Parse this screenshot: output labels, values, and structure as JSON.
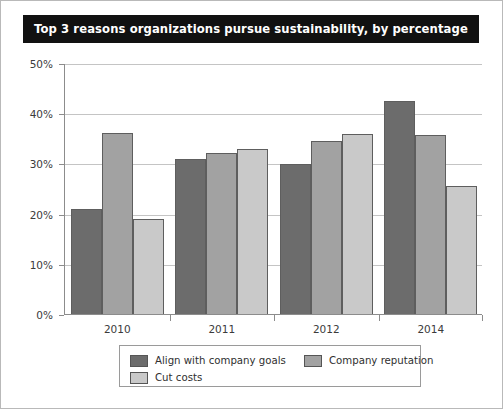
{
  "title": "Top 3 reasons organizations pursue sustainability, by percentage",
  "colors": {
    "title_bar_bg": "#111111",
    "title_text": "#ffffff",
    "series_1": "#6c6c6c",
    "series_2": "#a2a2a2",
    "series_3": "#c9c9c9",
    "gridline": "#c4c4c4",
    "axis": "#8c8c8c",
    "bar_border": "#5e5e5e",
    "tick_text": "#3b3b3b"
  },
  "chart_data": {
    "type": "bar",
    "title": "Top 3 reasons organizations pursue sustainability, by percentage",
    "xlabel": "",
    "ylabel": "",
    "ylim": [
      0,
      50
    ],
    "ytick_values": [
      0,
      10,
      20,
      30,
      40,
      50
    ],
    "ytick_labels": [
      "0%",
      "10%",
      "20%",
      "30%",
      "40%",
      "50%"
    ],
    "grid": true,
    "legend_position": "bottom",
    "categories": [
      "2010",
      "2011",
      "2012",
      "2014"
    ],
    "series": [
      {
        "name": "Align with company goals",
        "color": "#6c6c6c",
        "values": [
          21.0,
          30.9,
          29.8,
          42.5
        ]
      },
      {
        "name": "Company reputation",
        "color": "#a2a2a2",
        "values": [
          36.1,
          32.0,
          34.5,
          35.6
        ]
      },
      {
        "name": "Cut costs",
        "color": "#c9c9c9",
        "values": [
          18.9,
          32.9,
          35.8,
          25.5
        ]
      }
    ]
  }
}
